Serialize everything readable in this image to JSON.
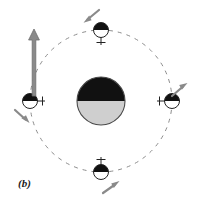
{
  "figure": {
    "label": "(b)",
    "label_x": 18,
    "label_y": 180,
    "width": 199,
    "height": 204,
    "background_color": "#ffffff",
    "type": "orbital-mechanics-diagram",
    "caption_panel": "b"
  },
  "colors": {
    "body_dark": "#111111",
    "body_light": "#cfcfcf",
    "body_outline": "#4a4a4a",
    "satellite_dark": "#111111",
    "satellite_light": "#ffffff",
    "satellite_outline": "#222222",
    "orbit_dash": "#8c8c8c",
    "arrow_gray": "#8a8a8a",
    "big_arrow_gray": "#8a8a8a",
    "label_color": "#1a1a1a"
  },
  "central_body": {
    "name": "central-body",
    "cx": 101,
    "cy": 101,
    "r": 24,
    "top_half_color": "#111111",
    "bottom_half_color": "#cfcfcf",
    "outline_color": "#4a4a4a"
  },
  "orbit": {
    "name": "orbit-path",
    "cx": 101,
    "cy": 101,
    "r": 71,
    "stroke": "#8c8c8c",
    "stroke_width": 1,
    "dash_pattern": "4 5",
    "style": "dashed"
  },
  "satellites": [
    {
      "id": "satellite-top",
      "position_label": "top",
      "cx": 101,
      "cy": 30,
      "r": 7.5,
      "dark_half": "top",
      "stem_direction": "down",
      "stem_length": 13,
      "crossbar_length": 9
    },
    {
      "id": "satellite-right",
      "position_label": "right",
      "cx": 172,
      "cy": 101,
      "r": 7.5,
      "dark_half": "top",
      "stem_direction": "left",
      "stem_length": 13,
      "crossbar_length": 9
    },
    {
      "id": "satellite-bottom",
      "position_label": "bottom",
      "cx": 101,
      "cy": 172,
      "r": 7.5,
      "dark_half": "top",
      "stem_direction": "up",
      "stem_length": 13,
      "crossbar_length": 9
    },
    {
      "id": "satellite-left",
      "position_label": "left",
      "cx": 30,
      "cy": 101,
      "r": 7.5,
      "dark_half": "top",
      "stem_direction": "right",
      "stem_length": 13,
      "crossbar_length": 9
    }
  ],
  "velocity_arrows": [
    {
      "id": "velocity-arrow-top",
      "near_satellite": "satellite-top",
      "x1": 99,
      "y1": 10,
      "x2": 84,
      "y2": 22,
      "direction": "down-left",
      "color": "#8a8a8a"
    },
    {
      "id": "velocity-arrow-right",
      "near_satellite": "satellite-right",
      "x1": 172,
      "y1": 96,
      "x2": 187,
      "y2": 83,
      "direction": "up-right",
      "color": "#8a8a8a"
    },
    {
      "id": "velocity-arrow-bottom",
      "near_satellite": "satellite-bottom",
      "x1": 103,
      "y1": 193,
      "x2": 119,
      "y2": 181,
      "direction": "up-right",
      "color": "#8a8a8a"
    },
    {
      "id": "velocity-arrow-left",
      "near_satellite": "satellite-left",
      "x1": 15,
      "y1": 110,
      "x2": 29,
      "y2": 123,
      "direction": "down-right",
      "color": "#8a8a8a"
    }
  ],
  "major_arrow": {
    "id": "spin-axis-arrow",
    "x": 34,
    "y_tail": 96,
    "y_head": 29,
    "direction": "up",
    "shaft_width": 4,
    "head_width": 11,
    "head_length": 10,
    "color": "#8a8a8a",
    "outline": "#6e6e6e"
  }
}
